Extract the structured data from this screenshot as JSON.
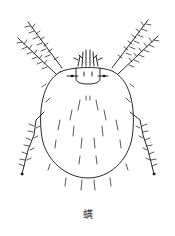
{
  "figure": {
    "style": "black line drawing on white",
    "colors": {
      "line": "#111111",
      "background": "#ffffff"
    }
  },
  "caption": {
    "text": "螨"
  }
}
